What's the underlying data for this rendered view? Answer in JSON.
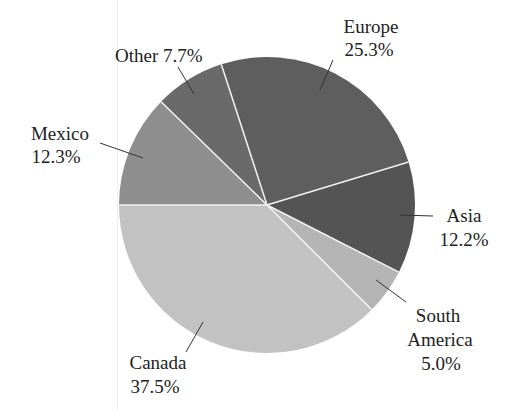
{
  "chart_data": {
    "type": "pie",
    "title": "",
    "start_angle_deg": 180,
    "direction": "clockwise",
    "slices": [
      {
        "label": "Mexico",
        "value": 12.3,
        "display": "12.3%",
        "color": "#8e8e8e"
      },
      {
        "label": "Other",
        "value": 7.7,
        "display": "7.7%",
        "color": "#6a6a6a"
      },
      {
        "label": "Europe",
        "value": 25.3,
        "display": "25.3%",
        "color": "#5e5e5e"
      },
      {
        "label": "Asia",
        "value": 12.2,
        "display": "12.2%",
        "color": "#545454"
      },
      {
        "label": "South America",
        "value": 5.0,
        "display": "5.0%",
        "color": "#b4b4b4"
      },
      {
        "label": "Canada",
        "value": 37.5,
        "display": "37.5%",
        "color": "#c2c2c2"
      }
    ],
    "legend": "none (direct labels with leader lines)"
  },
  "labels": {
    "mexico": {
      "name": "Mexico",
      "pct": "12.3%"
    },
    "other": {
      "text": "Other 7.7%"
    },
    "europe": {
      "name": "Europe",
      "pct": "25.3%"
    },
    "asia": {
      "name": "Asia",
      "pct": "12.2%"
    },
    "south_america": {
      "name1": "South",
      "name2": "America",
      "pct": "5.0%"
    },
    "canada": {
      "name": "Canada",
      "pct": "37.5%"
    }
  }
}
